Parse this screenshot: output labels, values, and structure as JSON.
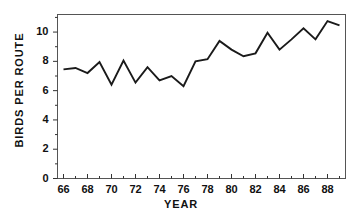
{
  "chart_data": {
    "type": "line",
    "title": "",
    "xlabel": "YEAR",
    "ylabel": "BIRDS PER ROUTE",
    "xlim": [
      65.5,
      89.5
    ],
    "ylim": [
      0,
      11.2
    ],
    "grid": false,
    "legend": null,
    "line_color": "#1a1a1a",
    "frame_color": "#555555",
    "x_major_ticks": [
      66,
      68,
      70,
      72,
      74,
      76,
      78,
      80,
      82,
      84,
      86,
      88
    ],
    "x_major_tick_labels": [
      "66",
      "68",
      "70",
      "72",
      "74",
      "76",
      "78",
      "80",
      "82",
      "84",
      "86",
      "88"
    ],
    "x_minor_ticks": [
      67,
      69,
      71,
      73,
      75,
      77,
      79,
      81,
      83,
      85,
      87,
      89
    ],
    "y_major_ticks": [
      0,
      2,
      4,
      6,
      8,
      10
    ],
    "y_major_tick_labels": [
      "0",
      "2",
      "4",
      "6",
      "8",
      "10"
    ],
    "y_minor_ticks": [
      1,
      3,
      5,
      7,
      9,
      11
    ],
    "x": [
      66,
      67,
      68,
      69,
      70,
      71,
      72,
      73,
      74,
      75,
      76,
      77,
      78,
      79,
      80,
      81,
      82,
      83,
      84,
      85,
      86,
      87,
      88,
      89
    ],
    "values": [
      7.45,
      7.55,
      7.2,
      7.95,
      6.4,
      8.05,
      6.55,
      7.6,
      6.7,
      7.0,
      6.3,
      8.0,
      8.15,
      9.4,
      8.8,
      8.35,
      8.55,
      9.95,
      8.8,
      9.5,
      10.25,
      9.5,
      10.75,
      10.45
    ],
    "series": [
      {
        "name": "Birds per route",
        "values": [
          7.45,
          7.55,
          7.2,
          7.95,
          6.4,
          8.05,
          6.55,
          7.6,
          6.7,
          7.0,
          6.3,
          8.0,
          8.15,
          9.4,
          8.8,
          8.35,
          8.55,
          9.95,
          8.8,
          9.5,
          10.25,
          9.5,
          10.75,
          10.45
        ]
      }
    ]
  },
  "axes": {
    "y_label": "BIRDS PER ROUTE",
    "x_label": "YEAR",
    "y_ticks": [
      "0",
      "2",
      "4",
      "6",
      "8",
      "10"
    ],
    "x_ticks": [
      "66",
      "68",
      "70",
      "72",
      "74",
      "76",
      "78",
      "80",
      "82",
      "84",
      "86",
      "88"
    ]
  }
}
